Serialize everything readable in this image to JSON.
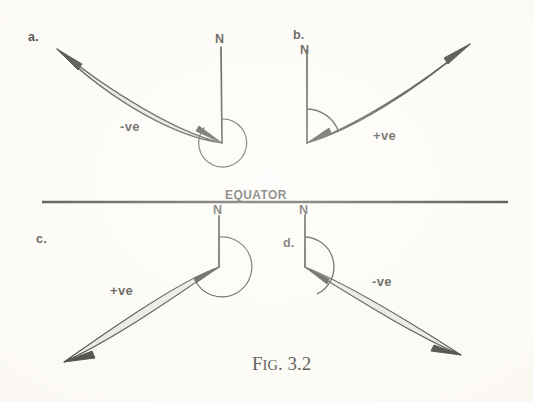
{
  "figure": {
    "caption_lead": "F",
    "caption_smallcaps": "IG",
    "caption_number": ". 3.2",
    "caption_full": "FIG. 3.2",
    "equator_label": "EQUATOR",
    "ink_color": "#17150f",
    "paper_color": "#fdfbf6"
  },
  "panels": [
    {
      "id": "a",
      "letter": "a.",
      "north_label": "N",
      "sign_label": "-ve",
      "sign": "negative",
      "quadrant": "top-left",
      "vertex": {
        "x": 222,
        "y": 143
      },
      "north_tip": {
        "x": 221,
        "y": 47
      },
      "arrow_tip": {
        "x": 57,
        "y": 49
      },
      "arc_type": "reflex",
      "arc_degrees": 290,
      "arc_radius": 24,
      "letter_pos": {
        "x": 28,
        "y": 30
      },
      "north_label_pos": {
        "x": 215,
        "y": 32
      },
      "sign_label_pos": {
        "x": 120,
        "y": 119
      }
    },
    {
      "id": "b",
      "letter": "b.",
      "north_label": "N",
      "sign_label": "+ve",
      "sign": "positive",
      "quadrant": "top-right",
      "vertex": {
        "x": 307,
        "y": 143
      },
      "north_tip": {
        "x": 307,
        "y": 50
      },
      "arrow_tip": {
        "x": 470,
        "y": 44
      },
      "arc_type": "acute",
      "arc_degrees": 60,
      "arc_radius": 34,
      "letter_pos": {
        "x": 293,
        "y": 28
      },
      "north_label_pos": {
        "x": 300,
        "y": 43
      },
      "sign_label_pos": {
        "x": 373,
        "y": 128
      }
    },
    {
      "id": "c",
      "letter": "c.",
      "north_label": "N",
      "sign_label": "+ve",
      "sign": "positive",
      "quadrant": "bottom-left",
      "vertex": {
        "x": 219,
        "y": 267
      },
      "north_tip": {
        "x": 219,
        "y": 216
      },
      "arrow_tip": {
        "x": 64,
        "y": 362
      },
      "arc_type": "reflex",
      "arc_degrees": 225,
      "arc_radius": 30,
      "letter_pos": {
        "x": 36,
        "y": 232
      },
      "north_label_pos": {
        "x": 213,
        "y": 211
      },
      "sign_label_pos": {
        "x": 110,
        "y": 283
      }
    },
    {
      "id": "d",
      "letter": "d.",
      "north_label": "N",
      "sign_label": "-ve",
      "sign": "negative",
      "quadrant": "bottom-right",
      "vertex": {
        "x": 305,
        "y": 267
      },
      "north_tip": {
        "x": 305,
        "y": 215
      },
      "arrow_tip": {
        "x": 461,
        "y": 355
      },
      "arc_type": "obtuse",
      "arc_degrees": 115,
      "arc_radius": 30,
      "letter_pos": {
        "x": 283,
        "y": 236
      },
      "north_label_pos": {
        "x": 299,
        "y": 211
      },
      "sign_label_pos": {
        "x": 372,
        "y": 274
      }
    }
  ],
  "equator": {
    "label": "EQUATOR",
    "x1": 42,
    "x2": 508,
    "y": 202,
    "label_pos": {
      "x": 225,
      "y": 190
    }
  },
  "caption_pos": {
    "x": 252,
    "y": 358
  }
}
